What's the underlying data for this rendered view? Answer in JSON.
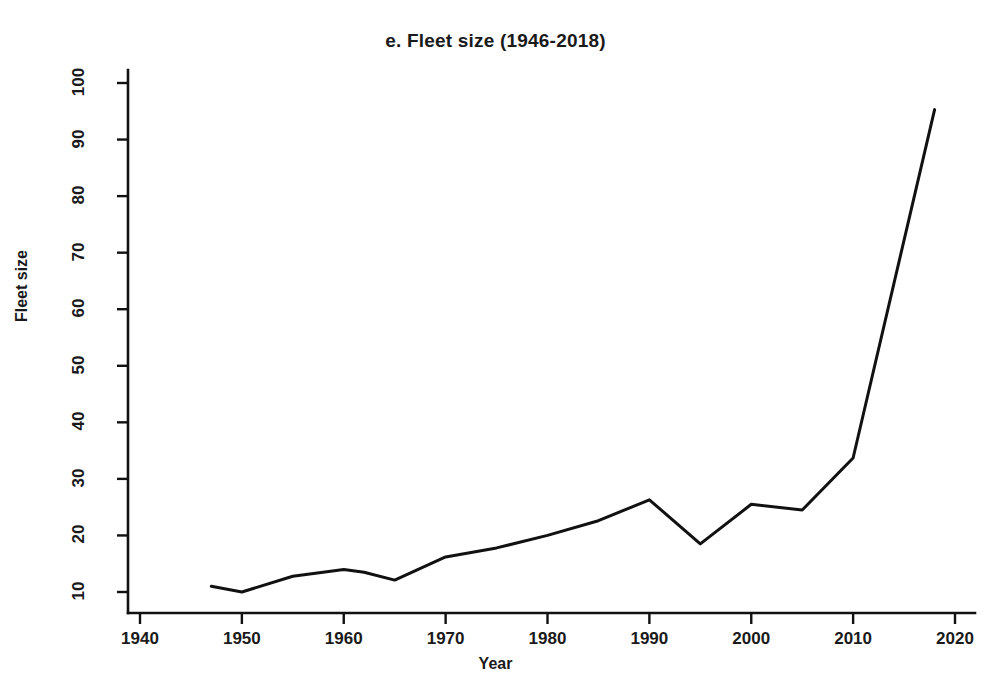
{
  "chart_data": {
    "type": "line",
    "title": "e. Fleet size (1946-2018)",
    "xlabel": "Year",
    "ylabel": "Fleet size",
    "grid": false,
    "legend": false,
    "xlim": [
      1936,
      2024
    ],
    "ylim": [
      6,
      103
    ],
    "xticks": [
      1940,
      1950,
      1960,
      1970,
      1980,
      1990,
      2000,
      2010,
      2020
    ],
    "yticks": [
      10,
      20,
      30,
      40,
      50,
      60,
      70,
      80,
      90,
      100
    ],
    "line_color": "#111111",
    "series": [
      {
        "name": "Fleet size",
        "x": [
          1947,
          1950,
          1955,
          1960,
          1962,
          1965,
          1970,
          1975,
          1980,
          1985,
          1990,
          1995,
          2000,
          2005,
          2010,
          2018
        ],
        "values": [
          11.0,
          10.0,
          12.8,
          14.0,
          13.5,
          12.1,
          16.2,
          17.8,
          20.0,
          22.6,
          26.3,
          18.5,
          25.5,
          24.5,
          33.7,
          95.3
        ]
      }
    ]
  },
  "axis": {
    "y_tick_labels": [
      "10",
      "20",
      "30",
      "40",
      "50",
      "60",
      "70",
      "80",
      "90",
      "100"
    ],
    "x_tick_labels": [
      "1940",
      "1950",
      "1960",
      "1970",
      "1980",
      "1990",
      "2000",
      "2010",
      "2020"
    ]
  }
}
